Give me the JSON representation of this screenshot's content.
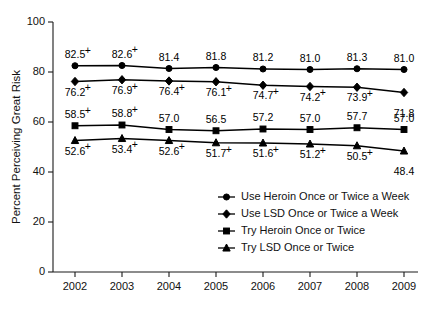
{
  "chart_data": {
    "type": "line",
    "title": "",
    "xlabel": "",
    "ylabel": "Percent Perceiving Great Risk",
    "categories": [
      "2002",
      "2003",
      "2004",
      "2005",
      "2006",
      "2007",
      "2008",
      "2009"
    ],
    "x": [
      2002,
      2003,
      2004,
      2005,
      2006,
      2007,
      2008,
      2009
    ],
    "ylim": [
      0,
      100
    ],
    "yticks": [
      "0",
      "20",
      "40",
      "60",
      "80",
      "100"
    ],
    "ytick_values": [
      0,
      20,
      40,
      60,
      80,
      100
    ],
    "grid": false,
    "legend_position": "inside-lower-right",
    "significance_marker": "+",
    "series": [
      {
        "name": "Use Heroin Once or Twice a Week",
        "marker": "circle",
        "label_position": "above",
        "values": [
          82.5,
          82.6,
          81.4,
          81.8,
          81.2,
          81.0,
          81.3,
          81.0
        ],
        "labels": [
          "82.5",
          "82.6",
          "81.4",
          "81.8",
          "81.2",
          "81.0",
          "81.3",
          "81.0"
        ],
        "significant": [
          true,
          true,
          false,
          false,
          false,
          false,
          false,
          false
        ]
      },
      {
        "name": "Use LSD Once or Twice a Week",
        "marker": "diamond",
        "label_position": "below",
        "values": [
          76.2,
          76.9,
          76.4,
          76.1,
          74.7,
          74.2,
          73.9,
          71.8
        ],
        "labels": [
          "76.2",
          "76.9",
          "76.4",
          "76.1",
          "74.7",
          "74.2",
          "73.9",
          "71.8"
        ],
        "significant": [
          true,
          true,
          true,
          true,
          true,
          true,
          true,
          false
        ]
      },
      {
        "name": "Try Heroin Once or Twice",
        "marker": "square",
        "label_position": "above",
        "values": [
          58.5,
          58.8,
          57.0,
          56.5,
          57.2,
          57.0,
          57.7,
          57.0
        ],
        "labels": [
          "58.5",
          "58.8",
          "57.0",
          "56.5",
          "57.2",
          "57.0",
          "57.7",
          "57.0"
        ],
        "significant": [
          true,
          true,
          false,
          false,
          false,
          false,
          false,
          false
        ]
      },
      {
        "name": "Try LSD Once or Twice",
        "marker": "triangle",
        "label_position": "below",
        "values": [
          52.6,
          53.4,
          52.6,
          51.7,
          51.6,
          51.2,
          50.5,
          48.4
        ],
        "labels": [
          "52.6",
          "53.4",
          "52.6",
          "51.7",
          "51.6",
          "51.2",
          "50.5",
          "48.4"
        ],
        "significant": [
          true,
          true,
          true,
          true,
          true,
          true,
          true,
          false
        ]
      }
    ]
  },
  "legend": {
    "items": [
      {
        "label": "Use Heroin Once or Twice a Week",
        "marker": "circle"
      },
      {
        "label": "Use LSD Once or Twice a Week",
        "marker": "diamond"
      },
      {
        "label": "Try Heroin Once or Twice",
        "marker": "square"
      },
      {
        "label": "Try LSD Once or Twice",
        "marker": "triangle"
      }
    ]
  }
}
